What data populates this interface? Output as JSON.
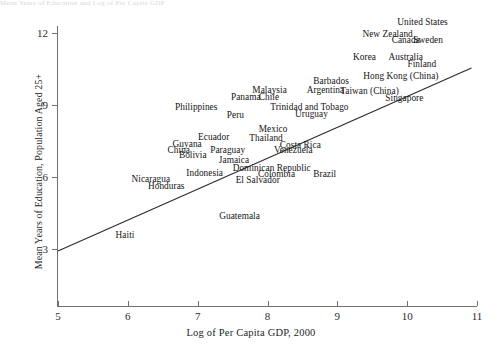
{
  "top_cropped_text": "Mean Years of Education and Log of Per Capita GDP",
  "chart_data": {
    "type": "scatter",
    "title": "",
    "xlabel": "Log of Per Capita GDP, 2000",
    "ylabel": "Mean Years of Education, Population Aged 25+",
    "xlim": [
      5,
      11
    ],
    "ylim": [
      3,
      12
    ],
    "xticks": [
      5,
      6,
      7,
      8,
      9,
      10,
      11
    ],
    "yticks": [
      3,
      6,
      9,
      12
    ],
    "grid": false,
    "legend": "none",
    "annotation_style": "country-name-labels",
    "trendline": {
      "present": true,
      "x_start": 5.0,
      "y_start": 2.92,
      "x_end": 10.92,
      "y_end": 10.54
    },
    "points": [
      {
        "label": "United States",
        "x": 10.22,
        "y": 12.45
      },
      {
        "label": "New Zealand",
        "x": 9.72,
        "y": 11.95
      },
      {
        "label": "Canada",
        "x": 9.98,
        "y": 11.7
      },
      {
        "label": "Sweden",
        "x": 10.3,
        "y": 11.7
      },
      {
        "label": "Korea",
        "x": 9.39,
        "y": 11.0
      },
      {
        "label": "Australia",
        "x": 9.98,
        "y": 11.0
      },
      {
        "label": "Finland",
        "x": 10.21,
        "y": 10.7
      },
      {
        "label": "Barbados",
        "x": 8.91,
        "y": 10.0
      },
      {
        "label": "Hong Kong (China)",
        "x": 9.91,
        "y": 10.2
      },
      {
        "label": "Malaysia",
        "x": 8.03,
        "y": 9.62
      },
      {
        "label": "Argentina",
        "x": 8.83,
        "y": 9.62
      },
      {
        "label": "Taiwan (China)",
        "x": 9.46,
        "y": 9.6
      },
      {
        "label": "Panama",
        "x": 7.69,
        "y": 9.35
      },
      {
        "label": "Chile",
        "x": 8.02,
        "y": 9.35
      },
      {
        "label": "Singapore",
        "x": 9.96,
        "y": 9.28
      },
      {
        "label": "Philippines",
        "x": 6.98,
        "y": 8.9
      },
      {
        "label": "Trinidad and Tobago",
        "x": 8.6,
        "y": 8.92
      },
      {
        "label": "Peru",
        "x": 7.54,
        "y": 8.6
      },
      {
        "label": "Uruguay",
        "x": 8.63,
        "y": 8.62
      },
      {
        "label": "Mexico",
        "x": 8.08,
        "y": 8.0
      },
      {
        "label": "Ecuador",
        "x": 7.23,
        "y": 7.68
      },
      {
        "label": "Thailand",
        "x": 7.98,
        "y": 7.62
      },
      {
        "label": "Guyana",
        "x": 6.85,
        "y": 7.38
      },
      {
        "label": "Costa Rica",
        "x": 8.47,
        "y": 7.35
      },
      {
        "label": "China",
        "x": 6.73,
        "y": 7.12
      },
      {
        "label": "Paraguay",
        "x": 7.43,
        "y": 7.12
      },
      {
        "label": "Venezuela",
        "x": 8.37,
        "y": 7.12
      },
      {
        "label": "Bolivia",
        "x": 6.93,
        "y": 6.9
      },
      {
        "label": "Jamaica",
        "x": 7.52,
        "y": 6.72
      },
      {
        "label": "Dominican Republic",
        "x": 8.06,
        "y": 6.38
      },
      {
        "label": "Indonesia",
        "x": 7.1,
        "y": 6.18
      },
      {
        "label": "Colombia",
        "x": 8.13,
        "y": 6.12
      },
      {
        "label": "Brazil",
        "x": 8.82,
        "y": 6.12
      },
      {
        "label": "Nicaragua",
        "x": 6.33,
        "y": 5.92
      },
      {
        "label": "El Salvador",
        "x": 7.86,
        "y": 5.88
      },
      {
        "label": "Honduras",
        "x": 6.55,
        "y": 5.62
      },
      {
        "label": "Guatemala",
        "x": 7.6,
        "y": 4.38
      },
      {
        "label": "Haiti",
        "x": 5.96,
        "y": 3.6
      }
    ]
  }
}
